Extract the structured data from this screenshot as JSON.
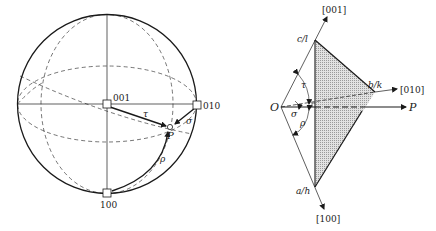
{
  "stereogram": {
    "poles": {
      "p001": "001",
      "p010": "010",
      "p100": "100"
    },
    "point_label": "P",
    "angles": {
      "tau": "τ",
      "sigma": "σ",
      "rho": "ρ"
    }
  },
  "plane_diagram": {
    "origin_label": "O",
    "axes": {
      "axis_001": "[001]",
      "axis_010": "[010]",
      "axis_100": "[100]"
    },
    "intercepts": {
      "c": "c/l",
      "b": "b/k",
      "a": "a/h"
    },
    "normal_label": "P",
    "angles": {
      "tau": "τ",
      "sigma": "σ",
      "rho": "ρ"
    }
  },
  "colors": {
    "ink": "#1a1a1a",
    "shade": "#d4d4d4"
  }
}
